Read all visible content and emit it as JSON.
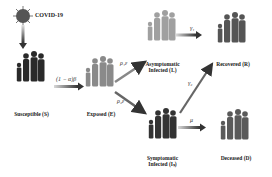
{
  "diagram": {
    "source": {
      "label": "COVID-19",
      "icon": "virus-icon"
    },
    "nodes": [
      {
        "id": "S",
        "label": "Susceptible (S)",
        "shade": "#2a2a2a"
      },
      {
        "id": "E",
        "label": "Exposed (E)",
        "shade": "#8a8a8a"
      },
      {
        "id": "IA",
        "label_line1": "Asymptomatic",
        "label_line2": "Infected (Iₐ)",
        "shade": "#9a9a9a"
      },
      {
        "id": "IS",
        "label_line1": "Symptomatic",
        "label_line2": "Infected (Iₛ)",
        "shade": "#333333"
      },
      {
        "id": "R",
        "label": "Recovered (R)",
        "shade": "#555555"
      },
      {
        "id": "D",
        "label": "Deceased (D)",
        "shade": "#5a5a5a"
      }
    ],
    "edges": [
      {
        "from": "COVID-19",
        "to": "S",
        "label": ""
      },
      {
        "from": "S",
        "to": "E",
        "label": "(1 − α)β"
      },
      {
        "from": "E",
        "to": "IA",
        "label": "ρ₁ε"
      },
      {
        "from": "E",
        "to": "IS",
        "label": "ρ₂ε"
      },
      {
        "from": "IA",
        "to": "R",
        "label": "γ₁"
      },
      {
        "from": "IS",
        "to": "R",
        "label": "γ₂"
      },
      {
        "from": "IS",
        "to": "D",
        "label": "μ"
      }
    ]
  }
}
